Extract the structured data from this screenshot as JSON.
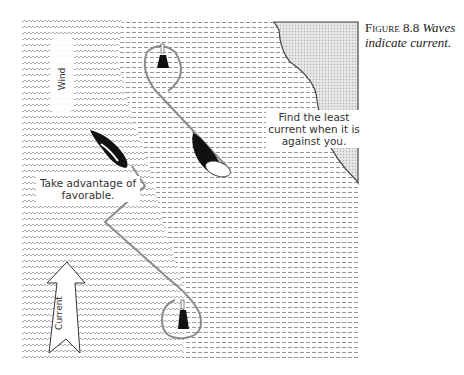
{
  "caption": {
    "figure_label": "Figure 8.8",
    "text": "Waves indicate current."
  },
  "annotations": {
    "upper": "Find the least current when it is against you.",
    "lower": "Take advantage of favorable."
  },
  "labels": {
    "wind": "Wind",
    "current": "Current"
  },
  "colors": {
    "background": "#ffffff",
    "wave_pattern": "#9a9a9a",
    "dash_pattern": "#8a8a8a",
    "shore_fill": "#d8d8d8",
    "shore_outline": "#444444",
    "course_line": "#8c8c8c",
    "boat_hull": "#111111",
    "buoy": "#111111"
  },
  "diagram": {
    "regions": [
      "strong-current-waves",
      "weak-current-dashes",
      "shore"
    ],
    "marks": [
      {
        "name": "upper-mark",
        "x": 163,
        "y": 58
      },
      {
        "name": "lower-mark",
        "x": 183,
        "y": 322
      }
    ],
    "boats": [
      {
        "name": "upper-boat",
        "heading": "down-right"
      },
      {
        "name": "lower-boat",
        "heading": "up-left"
      }
    ]
  }
}
